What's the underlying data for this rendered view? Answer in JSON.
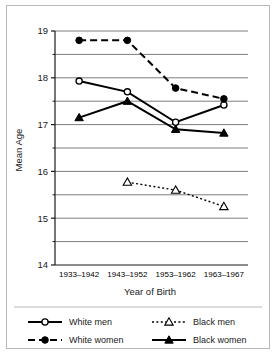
{
  "chart_data": {
    "type": "line",
    "title": "",
    "xlabel": "Year of Birth",
    "ylabel": "Mean Age",
    "categories": [
      "1933–1942",
      "1943–1952",
      "1953–1962",
      "1963–1967"
    ],
    "ylim": [
      14,
      19
    ],
    "yticks": [
      14,
      15,
      16,
      17,
      18,
      19
    ],
    "ytick_labels": [
      "14",
      "15",
      "16",
      "17",
      "18",
      "19"
    ],
    "gridlines": [
      14.5,
      15,
      15.5,
      16,
      16.5,
      17,
      17.5,
      18,
      18.5,
      19
    ],
    "grid": true,
    "legend_position": "bottom",
    "series": [
      {
        "name": "White men",
        "values": [
          17.93,
          17.7,
          17.05,
          17.42
        ],
        "line_style": "solid",
        "marker": "open-circle",
        "color": "#000000"
      },
      {
        "name": "Black men",
        "values": [
          null,
          15.77,
          15.6,
          15.25
        ],
        "line_style": "dotted",
        "marker": "open-triangle",
        "color": "#000000"
      },
      {
        "name": "White women",
        "values": [
          18.8,
          18.8,
          17.78,
          17.55
        ],
        "line_style": "dashed",
        "marker": "filled-circle",
        "color": "#000000"
      },
      {
        "name": "Black women",
        "values": [
          17.15,
          17.5,
          16.9,
          16.82
        ],
        "line_style": "solid",
        "marker": "filled-triangle",
        "color": "#000000"
      }
    ]
  },
  "legend": {
    "entries": [
      {
        "label": "White men",
        "series_index": 0
      },
      {
        "label": "Black men",
        "series_index": 1
      },
      {
        "label": "White women",
        "series_index": 2
      },
      {
        "label": "Black women",
        "series_index": 3
      }
    ]
  },
  "style": {
    "grid_color": "#7d7d7d",
    "axis_color": "#1a1a1a",
    "border_color": "#b9b9b9",
    "background": "#ffffff"
  }
}
